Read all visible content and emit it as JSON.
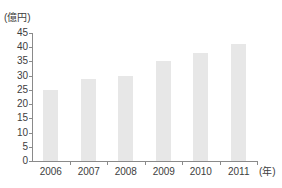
{
  "chart_data": {
    "type": "bar",
    "title": "",
    "y_unit_label": "(億円)",
    "x_unit_label": "(年)",
    "categories": [
      "2006",
      "2007",
      "2008",
      "2009",
      "2010",
      "2011"
    ],
    "values": [
      25,
      29,
      30,
      35,
      38,
      41
    ],
    "ylim": [
      0,
      45
    ],
    "ytick_step": 5,
    "yticks": [
      0,
      5,
      10,
      15,
      20,
      25,
      30,
      35,
      40,
      45
    ],
    "grid": false,
    "legend": "none",
    "bar_color": "#e7e7e7",
    "axis_color": "#8a8a8a",
    "text_color": "#3d3d3d",
    "background_color": "#ffffff"
  }
}
